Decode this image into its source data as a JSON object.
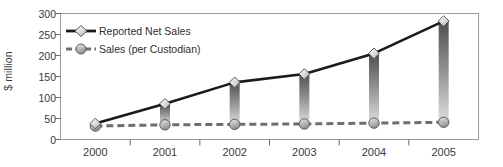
{
  "chart_data": {
    "type": "line",
    "title": "",
    "xlabel": "",
    "ylabel": "$ million",
    "categories": [
      "2000",
      "2001",
      "2002",
      "2003",
      "2004",
      "2005"
    ],
    "ylim": [
      0,
      300
    ],
    "yticks": [
      0,
      50,
      100,
      150,
      200,
      250,
      300
    ],
    "ytick_labels": [
      "0",
      "50",
      "100",
      "150",
      "200",
      "250",
      "300"
    ],
    "grid": false,
    "legend_position": "upper left",
    "series": [
      {
        "name": "Reported Net Sales",
        "style": "solid",
        "marker": "diamond",
        "color": "#1a1a1a",
        "values": [
          38,
          85,
          136,
          156,
          205,
          282
        ]
      },
      {
        "name": "Sales (per Custodian)",
        "style": "dashed",
        "marker": "circle",
        "color": "#6e6e6e",
        "values": [
          32,
          35,
          36,
          37,
          39,
          41
        ]
      }
    ],
    "drop_bars": {
      "description": "vertical gradient bars connecting each Sales (per Custodian) point up to the Reported Net Sales point",
      "color_top": "#5a5a5a",
      "color_bottom": "#d4d4d4"
    }
  },
  "axis": {
    "frame_color": "#9a9a9a",
    "tick_color": "#6a6a6a"
  },
  "legend": {
    "items": [
      {
        "label": "Reported Net Sales"
      },
      {
        "label": "Sales (per Custodian)"
      }
    ]
  }
}
